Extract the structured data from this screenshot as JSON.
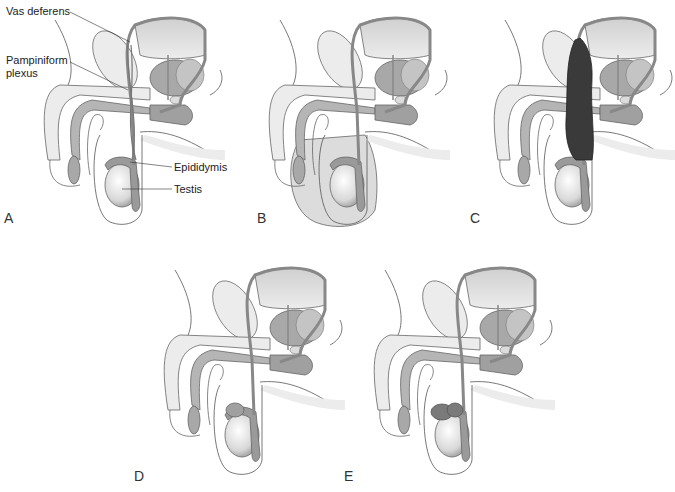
{
  "figure": {
    "panels": [
      {
        "id": "A",
        "letter": "A",
        "condition": "normal"
      },
      {
        "id": "B",
        "letter": "B",
        "condition": "hydrocele"
      },
      {
        "id": "C",
        "letter": "C",
        "condition": "varicocele"
      },
      {
        "id": "D",
        "letter": "D",
        "condition": "spermatocele"
      },
      {
        "id": "E",
        "letter": "E",
        "condition": "epididymal cyst"
      }
    ],
    "labels": {
      "vas_deferens": "Vas deferens",
      "pampiniform_line1": "Pampiniform",
      "pampiniform_line2": "plexus",
      "epididymis": "Epididymis",
      "testis": "Testis"
    },
    "colors": {
      "outline": "#555555",
      "light_fill": "#e6e6e6",
      "mid_fill": "#b0b0b0",
      "duct": "#888888",
      "dark_varicocele": "#3a3a3a",
      "hydrocele_fluid": "#dcdcdc"
    }
  }
}
